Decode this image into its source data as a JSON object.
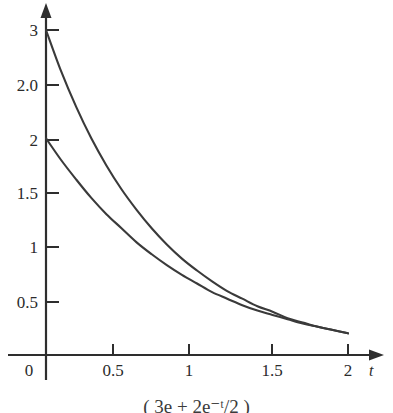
{
  "figure": {
    "background_color": "#ffffff",
    "axis_color": "#2e2e2e",
    "xaxis_name": "t",
    "yaxis_name": ""
  },
  "caption": {
    "partial_text": "( 3e + 2e⁻ᵗ/2 )",
    "note": "cut off at bottom edge"
  },
  "chart_data": {
    "type": "line",
    "title": "",
    "xlabel": "t",
    "ylabel": "",
    "xlim": [
      0,
      2.15
    ],
    "ylim": [
      0,
      3.15
    ],
    "grid": false,
    "legend": "none",
    "xticks": [
      0,
      0.5,
      1,
      1.5,
      2
    ],
    "xtick_labels": [
      "0",
      "0.5",
      "1",
      "1.5",
      "2"
    ],
    "yticks": [
      0.5,
      1,
      1.5,
      2,
      2.5,
      3
    ],
    "ytick_labels": [
      "0.5",
      "1",
      "1.5",
      "2",
      "2.0",
      "3"
    ],
    "series": [
      {
        "name": "upper-curve",
        "color": "#3a3a3a",
        "x": [
          0,
          0.1,
          0.2,
          0.3,
          0.4,
          0.5,
          0.6,
          0.7,
          0.8,
          0.9,
          1.0,
          1.1,
          1.2,
          1.3,
          1.4,
          1.5,
          1.6,
          1.7,
          1.8,
          1.9,
          2.0
        ],
        "y": [
          3.0,
          2.62,
          2.29,
          2.0,
          1.75,
          1.53,
          1.34,
          1.17,
          1.02,
          0.89,
          0.78,
          0.68,
          0.59,
          0.52,
          0.45,
          0.4,
          0.34,
          0.3,
          0.26,
          0.23,
          0.2
        ]
      },
      {
        "name": "lower-curve",
        "color": "#3a3a3a",
        "x": [
          0,
          0.1,
          0.2,
          0.3,
          0.4,
          0.5,
          0.6,
          0.7,
          0.8,
          0.9,
          1.0,
          1.1,
          1.2,
          1.3,
          1.4,
          1.5,
          1.6,
          1.7,
          1.8,
          1.9,
          2.0
        ],
        "y": [
          2.0,
          1.8,
          1.62,
          1.45,
          1.3,
          1.17,
          1.04,
          0.93,
          0.83,
          0.74,
          0.66,
          0.58,
          0.52,
          0.46,
          0.41,
          0.37,
          0.33,
          0.29,
          0.26,
          0.23,
          0.2
        ]
      }
    ]
  }
}
